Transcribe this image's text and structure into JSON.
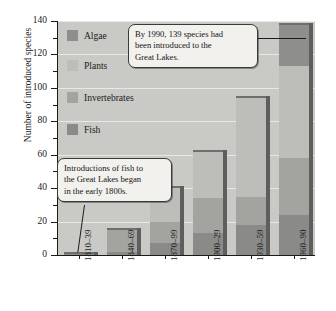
{
  "chart_data": {
    "type": "bar",
    "subtype": "stacked-vertical",
    "title": "",
    "xlabel": "",
    "ylabel": "Number of introduced species",
    "ylim": [
      0,
      140
    ],
    "ytick_values": [
      0,
      20,
      40,
      60,
      80,
      100,
      120,
      140
    ],
    "ytick_labels": [
      "0",
      "20",
      "40",
      "60",
      "80",
      "100",
      "120",
      "140"
    ],
    "yminor_values": [
      10,
      30,
      50,
      70,
      90,
      110,
      130
    ],
    "grid": true,
    "grid_axis": "y",
    "legend_position": "upper-left-inside",
    "categories": [
      "1810–39",
      "1840–69",
      "1870–99",
      "1900–29",
      "1930–59",
      "1960–90"
    ],
    "series": [
      {
        "name": "Fish",
        "color": "#8a8a88",
        "values": [
          2,
          2,
          7,
          13,
          18,
          24
        ]
      },
      {
        "name": "Invertebrates",
        "color": "#a3a3a0",
        "values": [
          0,
          14,
          13,
          21,
          17,
          34
        ]
      },
      {
        "name": "Plants",
        "color": "#bdbdba",
        "values": [
          0,
          0,
          21,
          29,
          60,
          55
        ]
      },
      {
        "name": "Algae",
        "color": "#8e8e8c",
        "values": [
          0,
          0,
          0,
          0,
          0,
          26
        ]
      }
    ],
    "totals": [
      2,
      16,
      41,
      63,
      95,
      139
    ],
    "annotations": [
      {
        "id": "top",
        "text": "By 1990, 139 species had been introduced to the Great Lakes.",
        "points_to": "1960–90 bar top"
      },
      {
        "id": "bottom",
        "text": "Introductions of fish to the Great Lakes began in the early 1800s.",
        "points_to": "1810–39 fish segment"
      }
    ]
  },
  "axis": {
    "y_title": "Number of introduced species"
  },
  "legend": {
    "items": [
      {
        "label": "Algae",
        "swatch": "algae-swatch"
      },
      {
        "label": "Plants",
        "swatch": "plants-swatch"
      },
      {
        "label": "Invertebrates",
        "swatch": "invertebrates-swatch"
      },
      {
        "label": "Fish",
        "swatch": "fish-swatch"
      }
    ]
  },
  "callouts": {
    "top": {
      "line1": "By 1990, 139 species had",
      "line2": "been introduced to the",
      "line3": "Great Lakes."
    },
    "bottom": {
      "line1": "Introductions of fish to",
      "line2": "the Great Lakes began",
      "line3": "in the early 1800s."
    }
  }
}
